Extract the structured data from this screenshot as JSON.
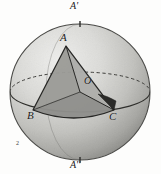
{
  "figure": {
    "background_color": "#fdfdfc",
    "sphere": {
      "center_x": 80,
      "center_y": 92,
      "radius_x": 70,
      "radius_y": 68,
      "fill_light": "#e6e6e4",
      "fill_mid": "#bdbdba",
      "fill_dark": "#8e8e8b",
      "outline_color": "#4a4a47"
    },
    "equator": {
      "label": "equator",
      "front_style": "solid",
      "back_style": "dashed",
      "rx": 70,
      "ry": 20,
      "color": "#3d3d3a"
    },
    "axis": {
      "label": "polar-axis",
      "top_point": [
        80,
        24
      ],
      "bottom_point": [
        80,
        160
      ]
    },
    "triangle": {
      "label": "spherical triangle ABC",
      "fill": "#a3a3a0",
      "edge_color": "#2a2a28",
      "vertices": [
        {
          "name": "A",
          "x": 66,
          "y": 46
        },
        {
          "name": "B",
          "x": 33,
          "y": 110
        },
        {
          "name": "C",
          "x": 114,
          "y": 110
        }
      ]
    },
    "angle_marker": {
      "label": "angle-marker-at-C",
      "fill": "#2b2b29",
      "at_vertex": "C"
    },
    "labels": [
      {
        "id": "pole-top",
        "text": "A'",
        "x": 70,
        "y": 1
      },
      {
        "id": "vertex-a",
        "text": "A",
        "x": 60,
        "y": 32
      },
      {
        "id": "center-o",
        "text": "O",
        "x": 84,
        "y": 76
      },
      {
        "id": "vertex-b",
        "text": "B",
        "x": 27,
        "y": 110
      },
      {
        "id": "vertex-c",
        "text": "C",
        "x": 109,
        "y": 111
      },
      {
        "id": "pole-bottom",
        "text": "A''",
        "x": 70,
        "y": 160
      },
      {
        "id": "figure-mark",
        "text": "2",
        "x": 16,
        "y": 140
      }
    ],
    "label_text": {
      "pole_top": "A'",
      "vertex_a": "A",
      "center_o": "O",
      "vertex_b": "B",
      "vertex_c": "C",
      "pole_bottom": "A''",
      "figure_mark": "2"
    }
  }
}
